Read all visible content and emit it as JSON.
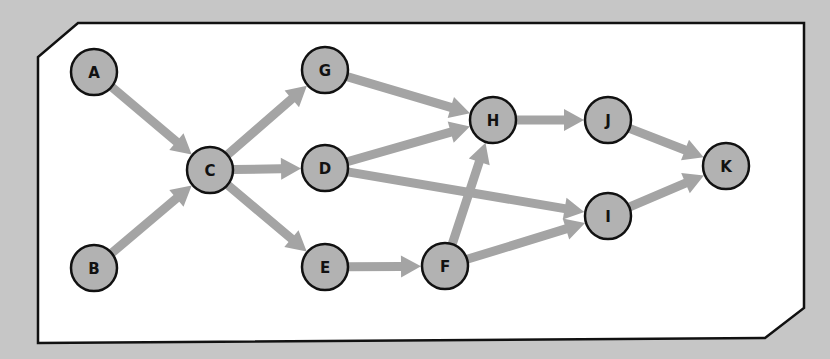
{
  "diagram": {
    "type": "directed-graph",
    "colors": {
      "background": "#c6c6c6",
      "panel": "#ffffff",
      "panel_border": "#111111",
      "node_fill": "#b2b2b2",
      "node_stroke": "#111111",
      "edge": "#a4a4a4"
    },
    "nodes": [
      {
        "id": "A",
        "label": "A",
        "x": 94,
        "y": 72
      },
      {
        "id": "B",
        "label": "B",
        "x": 94,
        "y": 268
      },
      {
        "id": "C",
        "label": "C",
        "x": 210,
        "y": 170
      },
      {
        "id": "G",
        "label": "G",
        "x": 325,
        "y": 70
      },
      {
        "id": "D",
        "label": "D",
        "x": 325,
        "y": 168
      },
      {
        "id": "E",
        "label": "E",
        "x": 325,
        "y": 267
      },
      {
        "id": "H",
        "label": "H",
        "x": 493,
        "y": 120
      },
      {
        "id": "F",
        "label": "F",
        "x": 445,
        "y": 266
      },
      {
        "id": "J",
        "label": "J",
        "x": 608,
        "y": 120
      },
      {
        "id": "I",
        "label": "I",
        "x": 608,
        "y": 216
      },
      {
        "id": "K",
        "label": "K",
        "x": 726,
        "y": 166
      }
    ],
    "edges": [
      {
        "from": "A",
        "to": "C"
      },
      {
        "from": "B",
        "to": "C"
      },
      {
        "from": "C",
        "to": "G"
      },
      {
        "from": "C",
        "to": "D"
      },
      {
        "from": "C",
        "to": "E"
      },
      {
        "from": "G",
        "to": "H"
      },
      {
        "from": "D",
        "to": "H"
      },
      {
        "from": "D",
        "to": "I"
      },
      {
        "from": "E",
        "to": "F"
      },
      {
        "from": "F",
        "to": "H"
      },
      {
        "from": "F",
        "to": "I"
      },
      {
        "from": "H",
        "to": "J"
      },
      {
        "from": "J",
        "to": "K"
      },
      {
        "from": "I",
        "to": "K"
      }
    ]
  }
}
